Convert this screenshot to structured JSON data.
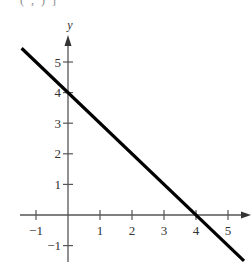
{
  "top_fragment": "(     ,     )  ]",
  "chart_data": {
    "type": "line",
    "title": "",
    "xlabel": "",
    "ylabel": "y",
    "xlim": [
      -1.5,
      5.7
    ],
    "ylim": [
      -1.5,
      5.8
    ],
    "grid": false,
    "legend": null,
    "x_ticks": [
      -1,
      1,
      2,
      3,
      4,
      5
    ],
    "y_ticks": [
      -1,
      1,
      2,
      3,
      4,
      5
    ],
    "series": [
      {
        "name": "y = -x + 4",
        "x": [
          -1.45,
          5.5
        ],
        "y": [
          5.45,
          -1.5
        ],
        "color": "#000000"
      }
    ],
    "annotations": [
      {
        "label": "y-intercept",
        "x": 0,
        "y": 4
      },
      {
        "label": "x-intercept",
        "x": 4,
        "y": 0
      }
    ]
  },
  "colors": {
    "axis": "#555555",
    "line": "#000000",
    "text": "#333333"
  }
}
